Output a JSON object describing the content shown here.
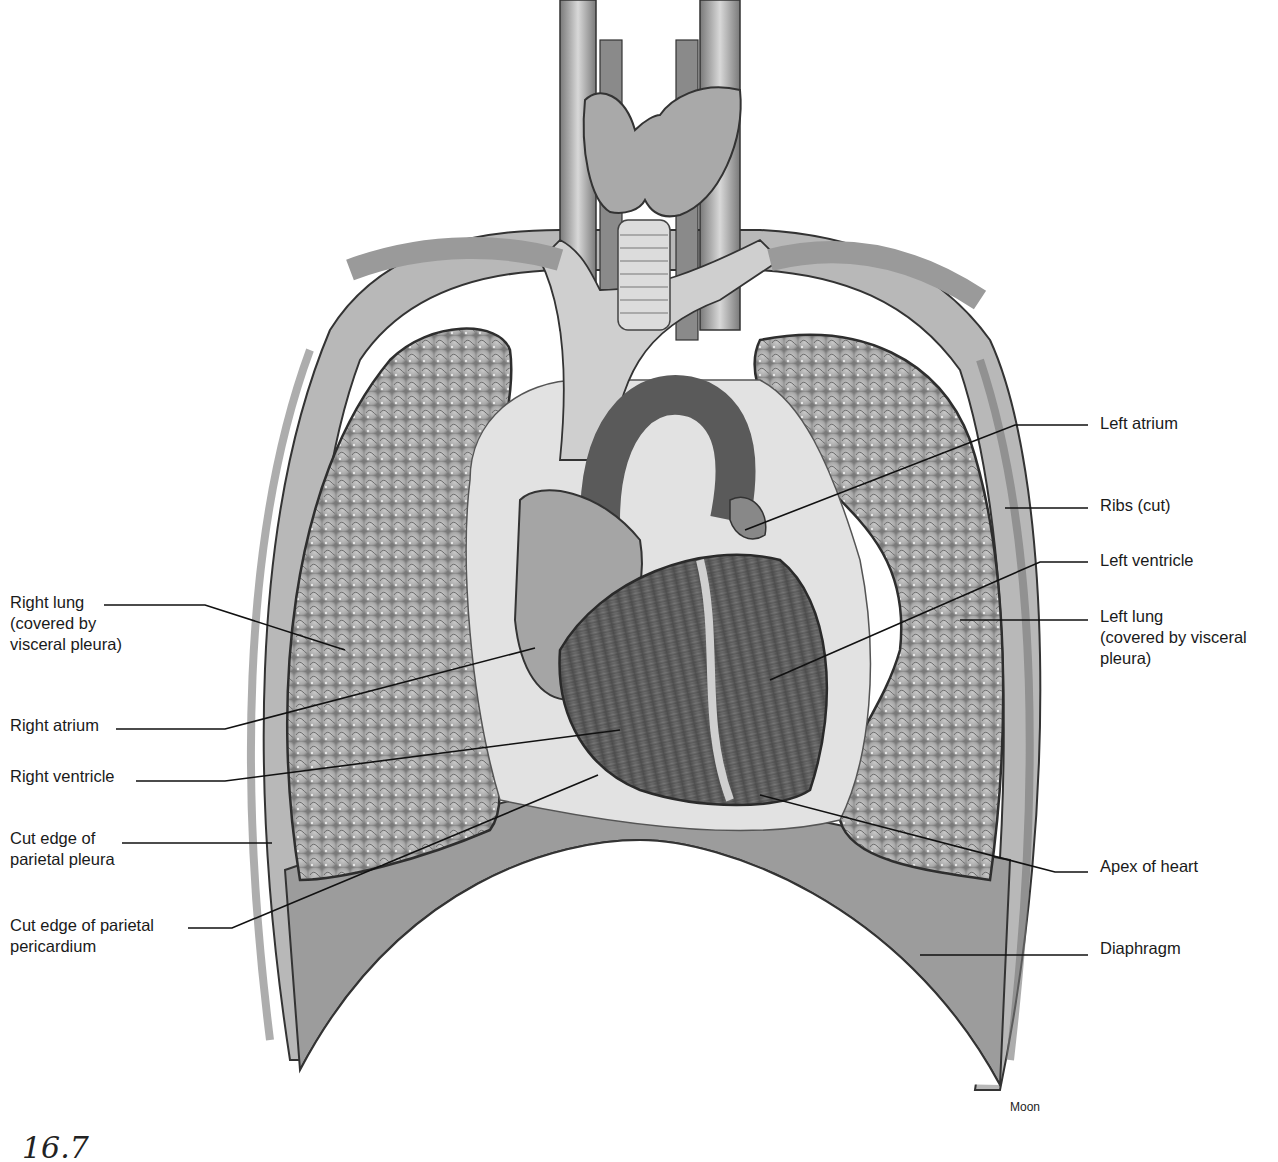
{
  "figure": {
    "figure_number": "16.7",
    "artist_credit": "Moon",
    "colors": {
      "background": "#ffffff",
      "ink": "#1a1a1a",
      "tissue_dark": "#5a5a5a",
      "tissue_mid": "#9a9a9a",
      "tissue_light": "#d6d6d6"
    }
  },
  "labels": {
    "left": [
      {
        "id": "right-lung",
        "text": "Right lung\n(covered by\nvisceral pleura)",
        "x": 10,
        "y": 592
      },
      {
        "id": "right-atrium",
        "text": "Right atrium",
        "x": 10,
        "y": 715
      },
      {
        "id": "right-ventricle",
        "text": "Right ventricle",
        "x": 10,
        "y": 766
      },
      {
        "id": "cut-edge-parietal-pleura",
        "text": "Cut edge of\nparietal pleura",
        "x": 10,
        "y": 828
      },
      {
        "id": "cut-edge-parietal-pericardium",
        "text": "Cut edge of parietal\npericardium",
        "x": 10,
        "y": 915
      }
    ],
    "right": [
      {
        "id": "left-atrium",
        "text": "Left atrium",
        "x": 1100,
        "y": 413
      },
      {
        "id": "ribs-cut",
        "text": "Ribs (cut)",
        "x": 1100,
        "y": 495
      },
      {
        "id": "left-ventricle",
        "text": "Left ventricle",
        "x": 1100,
        "y": 550
      },
      {
        "id": "left-lung",
        "text": "Left lung\n(covered by visceral\npleura)",
        "x": 1100,
        "y": 606
      },
      {
        "id": "apex-of-heart",
        "text": "Apex of heart",
        "x": 1100,
        "y": 856
      },
      {
        "id": "diaphragm",
        "text": "Diaphragm",
        "x": 1100,
        "y": 938
      }
    ]
  }
}
